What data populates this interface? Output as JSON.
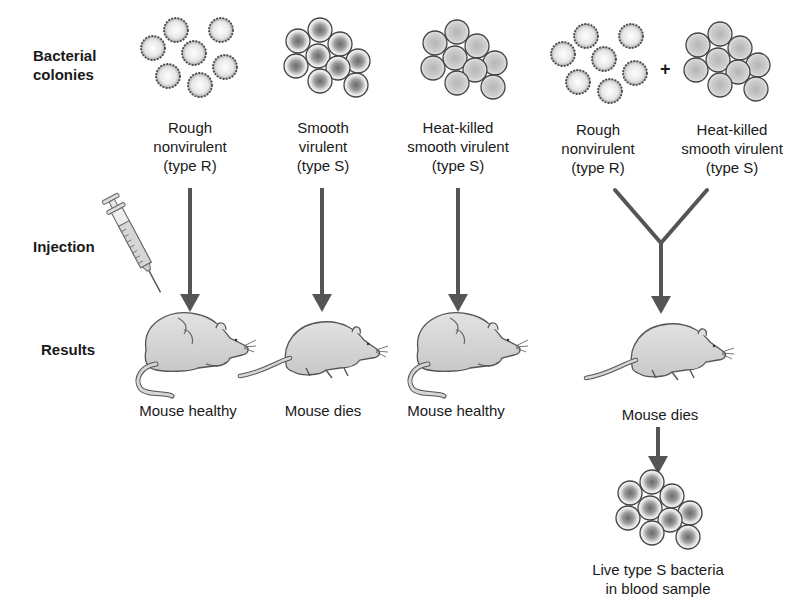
{
  "row_labels": {
    "colonies": "Bacterial colonies",
    "colonies_line1": "Bacterial",
    "colonies_line2": "colonies",
    "injection": "Injection",
    "results": "Results"
  },
  "columns": [
    {
      "id": "rough",
      "line1": "Rough",
      "line2": "nonvirulent",
      "line3": "(type R)",
      "colony": "rough",
      "result": "Mouse healthy"
    },
    {
      "id": "smooth",
      "line1": "Smooth",
      "line2": "virulent",
      "line3": "(type S)",
      "colony": "smooth-live",
      "result": "Mouse dies"
    },
    {
      "id": "heat-killed",
      "line1": "Heat-killed",
      "line2": "smooth virulent",
      "line3": "(type S)",
      "colony": "smooth-dead",
      "result": "Mouse healthy"
    },
    {
      "id": "mixture",
      "left": {
        "line1": "Rough",
        "line2": "nonvirulent",
        "line3": "(type R)"
      },
      "operator": "+",
      "right": {
        "line1": "Heat-killed",
        "line2": "smooth virulent",
        "line3": "(type S)"
      },
      "result": "Mouse dies"
    }
  ],
  "final": {
    "line1": "Live type S bacteria",
    "line2": "in blood sample"
  },
  "colors": {
    "arrow": "#555555",
    "mouse_fill": "#d9d9d9",
    "mouse_stroke": "#555555",
    "text": "#1a1a1a"
  }
}
